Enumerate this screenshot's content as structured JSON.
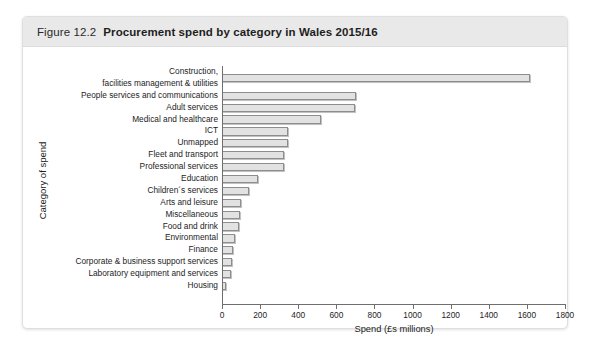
{
  "figure": {
    "number": "Figure 12.2",
    "title": "Procurement spend by category in Wales 2015/16"
  },
  "chart_data": {
    "type": "bar",
    "orientation": "horizontal",
    "title": "Procurement spend by category in Wales 2015/16",
    "xlabel": "Spend (£s millions)",
    "ylabel": "Category of spend",
    "xlim": [
      0,
      1800
    ],
    "xticks": [
      0,
      200,
      400,
      600,
      800,
      1000,
      1200,
      1400,
      1600,
      1800
    ],
    "grid": false,
    "legend": false,
    "categories": [
      "Construction, facilities management & utilities",
      "People services and communications",
      "Adult services",
      "Medical and healthcare",
      "ICT",
      "Unmapped",
      "Fleet and transport",
      "Professional services",
      "Education",
      "Children´s services",
      "Arts and leisure",
      "Miscellaneous",
      "Food and drink",
      "Environmental",
      "Finance",
      "Corporate & business support services",
      "Laboratory equipment and services",
      "Housing"
    ],
    "category_lines": [
      [
        "Construction,",
        "facilities management & utilities"
      ],
      [
        "People services and communications"
      ],
      [
        "Adult services"
      ],
      [
        "Medical and healthcare"
      ],
      [
        "ICT"
      ],
      [
        "Unmapped"
      ],
      [
        "Fleet and transport"
      ],
      [
        "Professional services"
      ],
      [
        "Education"
      ],
      [
        "Children´s services"
      ],
      [
        "Arts and leisure"
      ],
      [
        "Miscellaneous"
      ],
      [
        "Food and drink"
      ],
      [
        "Environmental"
      ],
      [
        "Finance"
      ],
      [
        "Corporate & business support services"
      ],
      [
        "Laboratory equipment and services"
      ],
      [
        "Housing"
      ]
    ],
    "values": [
      1615,
      705,
      700,
      520,
      345,
      345,
      325,
      325,
      190,
      140,
      98,
      95,
      90,
      70,
      60,
      52,
      45,
      22
    ]
  },
  "colors": {
    "caption_background": "#e9e9e9",
    "bar_fill": "#e2e2e2",
    "bar_stroke": "#8d8d8d",
    "axis": "#6f6f6f",
    "text": "#1d1d1d",
    "page_background": "#ffffff"
  }
}
